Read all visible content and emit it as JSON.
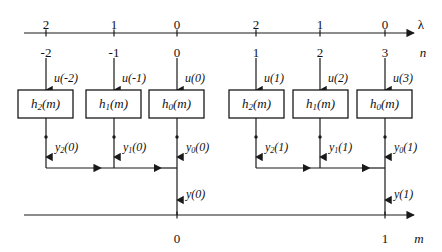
{
  "figure": {
    "type": "signal-flow-diagram"
  },
  "top_axis": {
    "variable": "λ",
    "line": {
      "x1": 24,
      "x2": 414,
      "y": 33
    },
    "lambda_values": [
      "2",
      "1",
      "0",
      "2",
      "1",
      "0"
    ],
    "n_variable": "n",
    "n_values": [
      "-2",
      "-1",
      "0",
      "1",
      "2",
      "3"
    ],
    "tick_x": [
      46,
      114,
      177,
      256,
      320,
      385
    ],
    "lambda_row_y": 18,
    "n_row_y": 46
  },
  "bottom_axis": {
    "variable": "m",
    "line": {
      "x1": 24,
      "x2": 414,
      "y": 215
    },
    "tick_x": [
      177,
      385
    ],
    "values": [
      "0",
      "1"
    ],
    "label_row_y": 232
  },
  "blocks": [
    {
      "label_h": "h",
      "label_sub": "2",
      "label_tail": "(m)",
      "x": 18,
      "y": 90,
      "w": 55,
      "h": 28,
      "cx": 46
    },
    {
      "label_h": "h",
      "label_sub": "1",
      "label_tail": "(m)",
      "x": 86,
      "y": 90,
      "w": 55,
      "h": 28,
      "cx": 114
    },
    {
      "label_h": "h",
      "label_sub": "0",
      "label_tail": "(m)",
      "x": 149,
      "y": 90,
      "w": 55,
      "h": 28,
      "cx": 177
    },
    {
      "label_h": "h",
      "label_sub": "2",
      "label_tail": "(m)",
      "x": 229,
      "y": 90,
      "w": 55,
      "h": 28,
      "cx": 256
    },
    {
      "label_h": "h",
      "label_sub": "1",
      "label_tail": "(m)",
      "x": 293,
      "y": 90,
      "w": 55,
      "h": 28,
      "cx": 320
    },
    {
      "label_h": "h",
      "label_sub": "0",
      "label_tail": "(m)",
      "x": 357,
      "y": 90,
      "w": 55,
      "h": 28,
      "cx": 385
    }
  ],
  "inputs": [
    {
      "label": "u(-2)",
      "x": 46,
      "label_x": 54,
      "label_y": 72
    },
    {
      "label": "u(-1)",
      "x": 114,
      "label_x": 122,
      "label_y": 72
    },
    {
      "label": "u(0)",
      "x": 177,
      "label_x": 185,
      "label_y": 72
    },
    {
      "label": "u(1)",
      "x": 256,
      "label_x": 264,
      "label_y": 72
    },
    {
      "label": "u(2)",
      "x": 320,
      "label_x": 328,
      "label_y": 72
    },
    {
      "label": "u(3)",
      "x": 385,
      "label_x": 393,
      "label_y": 72
    }
  ],
  "outputs": [
    {
      "base": "y",
      "sub": "2",
      "tail": "(0)",
      "x": 46,
      "label_x": 55,
      "label_y": 141
    },
    {
      "base": "y",
      "sub": "1",
      "tail": "(0)",
      "x": 114,
      "label_x": 123,
      "label_y": 141
    },
    {
      "base": "y",
      "sub": "0",
      "tail": "(0)",
      "x": 177,
      "label_x": 186,
      "label_y": 141
    },
    {
      "base": "y",
      "sub": "2",
      "tail": "(1)",
      "x": 256,
      "label_x": 265,
      "label_y": 141
    },
    {
      "base": "y",
      "sub": "1",
      "tail": "(1)",
      "x": 320,
      "label_x": 329,
      "label_y": 141
    },
    {
      "base": "y",
      "sub": "0",
      "tail": "(1)",
      "x": 385,
      "label_x": 394,
      "label_y": 141
    }
  ],
  "sums": [
    {
      "label": "y(0)",
      "bus_y": 168,
      "x_start": 46,
      "x_end": 177,
      "out_x": 177,
      "label_x": 186,
      "label_y": 188
    },
    {
      "label": "y(1)",
      "bus_y": 168,
      "x_start": 256,
      "x_end": 385,
      "out_x": 385,
      "label_x": 394,
      "label_y": 188
    }
  ],
  "geometry": {
    "input_arrow_top_y": 58,
    "block_top_y": 90,
    "block_bottom_y": 118,
    "mid_dot_y": 137,
    "mid_arrow_y": 157,
    "bus_y": 168,
    "out_arrow_end_y": 200,
    "bottom_axis_y": 215
  },
  "colors": {
    "stroke": "#1a1a1a",
    "background": "#ffffff",
    "text": "#111111"
  }
}
